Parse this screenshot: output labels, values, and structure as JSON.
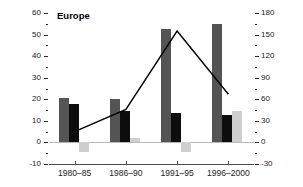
{
  "chart_data": {
    "type": "bar",
    "title": "Europe",
    "xlabel": "",
    "ylabel": "",
    "categories": [
      "1980–85",
      "1986–90",
      "1991–95",
      "1996–2000"
    ],
    "series": [
      {
        "name": "series-1-dark-gray",
        "type": "bar",
        "axis": "left",
        "color": "#545454",
        "values": [
          20.5,
          20.0,
          52.5,
          55.0
        ]
      },
      {
        "name": "series-2-black",
        "type": "bar",
        "axis": "left",
        "color": "#0d0d0d",
        "values": [
          18.0,
          14.5,
          13.5,
          12.5
        ]
      },
      {
        "name": "series-3-light-gray",
        "type": "bar",
        "axis": "left",
        "color": "#cfcfcf",
        "values": [
          -4.5,
          2.0,
          -4.5,
          14.5
        ]
      },
      {
        "name": "series-4-line",
        "type": "line",
        "axis": "right",
        "color": "#000000",
        "values": [
          15,
          46,
          155,
          67
        ]
      }
    ],
    "left_axis": {
      "ticks": [
        -10,
        0,
        10,
        20,
        30,
        40,
        50,
        60
      ],
      "minor_ticks": [
        -5,
        5,
        15,
        25,
        35,
        45,
        55
      ],
      "ylim": [
        -10,
        60
      ]
    },
    "right_axis": {
      "ticks": [
        -30,
        0,
        30,
        60,
        90,
        120,
        150,
        180
      ],
      "minor_ticks": [
        -15,
        15,
        45,
        75,
        105,
        135,
        165
      ],
      "ylim": [
        -30,
        180
      ]
    },
    "grid": false,
    "legend": "none"
  }
}
